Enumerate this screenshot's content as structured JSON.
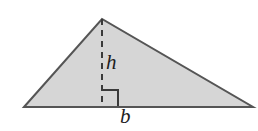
{
  "figure": {
    "name": "triangle-with-base-and-height",
    "background_color": "#ffffff",
    "canvas": {
      "width": 258,
      "height": 131
    },
    "shape": {
      "type": "triangle",
      "fill_color": "#d6d6d6",
      "stroke_color": "#555555",
      "stroke_width": 2,
      "vertices": [
        {
          "name": "left-base-vertex",
          "x": 24,
          "y": 107
        },
        {
          "name": "apex-vertex",
          "x": 102,
          "y": 19
        },
        {
          "name": "right-base-vertex",
          "x": 253,
          "y": 107
        }
      ]
    },
    "height_segment": {
      "name": "height-dashed-line",
      "x": 102,
      "y_top": 19,
      "y_bottom": 107,
      "stroke_color": "#3a3a3a",
      "stroke_width": 2,
      "dash_pattern": "6 5"
    },
    "right_angle_marker": {
      "name": "right-angle-square",
      "x": 102,
      "y": 90,
      "size": 16,
      "stroke_color": "#3a3a3a",
      "stroke_width": 2
    },
    "labels": {
      "height": "h",
      "base": "b"
    }
  }
}
